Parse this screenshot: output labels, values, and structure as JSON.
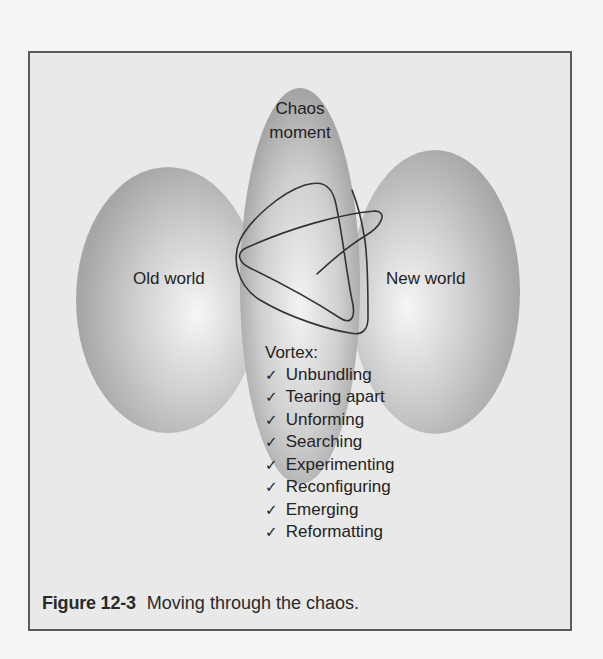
{
  "figure": {
    "number": "Figure 12-3",
    "caption": "Moving through the chaos."
  },
  "diagram": {
    "center": {
      "title_line1": "Chaos",
      "title_line2": "moment"
    },
    "left": {
      "label": "Old world"
    },
    "right": {
      "label": "New world"
    },
    "vortex": {
      "heading": "Vortex:",
      "check_icon": "✓",
      "items": [
        "Unbundling",
        "Tearing apart",
        "Unforming",
        "Searching",
        "Experimenting",
        "Reconfiguring",
        "Emerging",
        "Reformatting"
      ]
    }
  },
  "colors": {
    "frame_border": "#5a5a5a",
    "frame_fill": "#e9e9e9",
    "bubble_light": "#f2f2f2",
    "bubble_dark": "#a9a9a9",
    "squiggle": "#333333",
    "text": "#232323"
  }
}
